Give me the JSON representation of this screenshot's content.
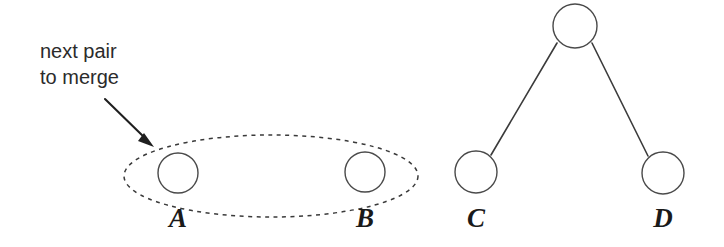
{
  "diagram": {
    "background_color": "#ffffff",
    "stroke_color": "#3b3b3b",
    "node_fill_color": "#ffffff",
    "text_color": "#2b2b2b",
    "annotation": {
      "line1": "next pair",
      "line2": "to merge",
      "arrow_label": "arrow pointing to grouped pair"
    },
    "group": {
      "shape": "dashed-ellipse",
      "contains": [
        "A",
        "B"
      ]
    },
    "left_cluster": {
      "nodes": [
        {
          "id": "A",
          "label": "A",
          "cx": 178,
          "cy": 173,
          "r": 20
        },
        {
          "id": "B",
          "label": "B",
          "cx": 365,
          "cy": 172,
          "r": 20
        }
      ]
    },
    "right_tree": {
      "root": {
        "id": "root",
        "label": "",
        "cx": 575,
        "cy": 26,
        "r": 22
      },
      "leaves": [
        {
          "id": "C",
          "label": "C",
          "cx": 476,
          "cy": 172,
          "r": 21
        },
        {
          "id": "D",
          "label": "D",
          "cx": 663,
          "cy": 173,
          "r": 21
        }
      ],
      "edges": [
        {
          "from": "root",
          "to": "C"
        },
        {
          "from": "root",
          "to": "D"
        }
      ]
    }
  }
}
